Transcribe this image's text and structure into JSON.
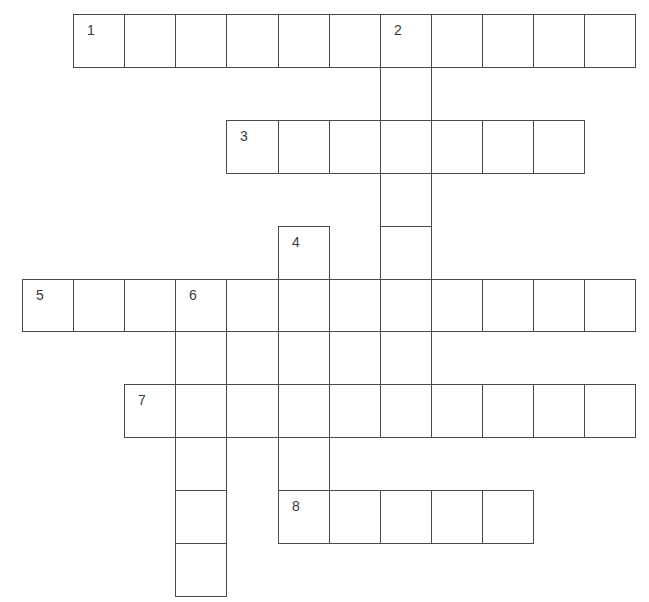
{
  "puzzle": {
    "type": "crossword",
    "grid": {
      "origin_x": 22,
      "origin_y": 14,
      "cell_w": 51.1,
      "cell_h": 52.9,
      "line_color": "#4a4a4a",
      "number_color": "#3a3a3a"
    },
    "cells": [
      {
        "r": 0,
        "c": 1,
        "n": "1"
      },
      {
        "r": 0,
        "c": 2
      },
      {
        "r": 0,
        "c": 3
      },
      {
        "r": 0,
        "c": 4
      },
      {
        "r": 0,
        "c": 5
      },
      {
        "r": 0,
        "c": 6
      },
      {
        "r": 0,
        "c": 7,
        "n": "2"
      },
      {
        "r": 0,
        "c": 8
      },
      {
        "r": 0,
        "c": 9
      },
      {
        "r": 0,
        "c": 10
      },
      {
        "r": 0,
        "c": 11
      },
      {
        "r": 1,
        "c": 7
      },
      {
        "r": 2,
        "c": 4,
        "n": "3"
      },
      {
        "r": 2,
        "c": 5
      },
      {
        "r": 2,
        "c": 6
      },
      {
        "r": 2,
        "c": 7
      },
      {
        "r": 2,
        "c": 8
      },
      {
        "r": 2,
        "c": 9
      },
      {
        "r": 2,
        "c": 10
      },
      {
        "r": 3,
        "c": 7
      },
      {
        "r": 4,
        "c": 5,
        "n": "4"
      },
      {
        "r": 4,
        "c": 7
      },
      {
        "r": 5,
        "c": 0,
        "n": "5"
      },
      {
        "r": 5,
        "c": 1
      },
      {
        "r": 5,
        "c": 2
      },
      {
        "r": 5,
        "c": 3,
        "n": "6"
      },
      {
        "r": 5,
        "c": 4
      },
      {
        "r": 5,
        "c": 5
      },
      {
        "r": 5,
        "c": 6
      },
      {
        "r": 5,
        "c": 7
      },
      {
        "r": 5,
        "c": 8
      },
      {
        "r": 5,
        "c": 9
      },
      {
        "r": 5,
        "c": 10
      },
      {
        "r": 5,
        "c": 11
      },
      {
        "r": 6,
        "c": 3
      },
      {
        "r": 6,
        "c": 4
      },
      {
        "r": 6,
        "c": 5
      },
      {
        "r": 6,
        "c": 6
      },
      {
        "r": 6,
        "c": 7
      },
      {
        "r": 7,
        "c": 2,
        "n": "7"
      },
      {
        "r": 7,
        "c": 3
      },
      {
        "r": 7,
        "c": 4
      },
      {
        "r": 7,
        "c": 5
      },
      {
        "r": 7,
        "c": 6
      },
      {
        "r": 7,
        "c": 7
      },
      {
        "r": 7,
        "c": 8
      },
      {
        "r": 7,
        "c": 9
      },
      {
        "r": 7,
        "c": 10
      },
      {
        "r": 7,
        "c": 11
      },
      {
        "r": 8,
        "c": 3
      },
      {
        "r": 8,
        "c": 5
      },
      {
        "r": 9,
        "c": 3
      },
      {
        "r": 9,
        "c": 5,
        "n": "8"
      },
      {
        "r": 9,
        "c": 6
      },
      {
        "r": 9,
        "c": 7
      },
      {
        "r": 9,
        "c": 8
      },
      {
        "r": 9,
        "c": 9
      },
      {
        "r": 10,
        "c": 3
      }
    ],
    "entries": [
      {
        "number": "1",
        "direction": "across",
        "length": 11
      },
      {
        "number": "2",
        "direction": "down",
        "length": 8
      },
      {
        "number": "3",
        "direction": "across",
        "length": 7
      },
      {
        "number": "4",
        "direction": "down",
        "length": 6
      },
      {
        "number": "5",
        "direction": "across",
        "length": 12
      },
      {
        "number": "6",
        "direction": "down",
        "length": 6
      },
      {
        "number": "7",
        "direction": "across",
        "length": 10
      },
      {
        "number": "8",
        "direction": "across",
        "length": 5
      }
    ]
  }
}
